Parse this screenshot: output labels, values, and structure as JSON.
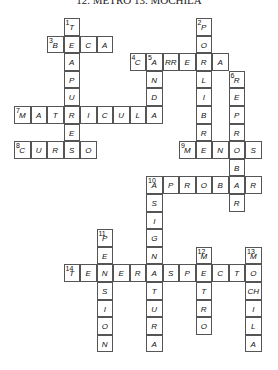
{
  "caption": "12. METRO  13. MOCHILA",
  "grid": {
    "x0": 14,
    "y0": 18,
    "cell_w": 16.5,
    "cell_h": 17.6
  },
  "words": [
    {
      "num": "1",
      "dir": "down",
      "col": 3,
      "row": 0,
      "letters": [
        "T",
        "E",
        "A",
        "P",
        "U",
        "R",
        "E"
      ]
    },
    {
      "num": "2",
      "dir": "down",
      "col": 11,
      "row": 0,
      "letters": [
        "P",
        "O",
        "R",
        "L",
        "I",
        "B",
        "R",
        "E"
      ]
    },
    {
      "num": "3",
      "dir": "across",
      "col": 2,
      "row": 1,
      "letters": [
        "B",
        "E",
        "C",
        "A"
      ]
    },
    {
      "num": "4",
      "dir": "across",
      "col": 7,
      "row": 2,
      "letters": [
        "C",
        "A",
        "RR",
        "E",
        "R",
        "A"
      ]
    },
    {
      "num": "5",
      "dir": "down",
      "col": 8,
      "row": 2,
      "letters": [
        "A",
        "N",
        "D",
        "A"
      ]
    },
    {
      "num": "6",
      "dir": "down",
      "col": 13,
      "row": 3,
      "letters": [
        "R",
        "E",
        "P",
        "R",
        "O",
        "B",
        "A",
        "R"
      ]
    },
    {
      "num": "7",
      "dir": "across",
      "col": 0,
      "row": 5,
      "letters": [
        "M",
        "A",
        "T",
        "R",
        "I",
        "C",
        "U",
        "L",
        "A"
      ]
    },
    {
      "num": "8",
      "dir": "across",
      "col": 0,
      "row": 7,
      "letters": [
        "C",
        "U",
        "R",
        "S",
        "O"
      ]
    },
    {
      "num": "9",
      "dir": "across",
      "col": 10,
      "row": 7,
      "letters": [
        "M",
        "E",
        "N",
        "O",
        "S"
      ]
    },
    {
      "num": "10",
      "dir": "across",
      "col": 8,
      "row": 9,
      "letters": [
        "A",
        "P",
        "R",
        "O",
        "B",
        "A",
        "R"
      ]
    },
    {
      "num": "10",
      "dir": "down",
      "col": 8,
      "row": 9,
      "letters": [
        "A",
        "S",
        "I",
        "G",
        "N",
        "A",
        "T",
        "U",
        "R",
        "A"
      ]
    },
    {
      "num": "11",
      "dir": "down",
      "col": 5,
      "row": 12,
      "letters": [
        "P",
        "E",
        "N",
        "S",
        "I",
        "O",
        "N"
      ]
    },
    {
      "num": "12",
      "dir": "down",
      "col": 11,
      "row": 13,
      "letters": [
        "M",
        "E",
        "T",
        "R",
        "O"
      ]
    },
    {
      "num": "13",
      "dir": "down",
      "col": 14,
      "row": 13,
      "letters": [
        "M",
        "O",
        "CH",
        "I",
        "L",
        "A"
      ]
    },
    {
      "num": "14",
      "dir": "across",
      "col": 3,
      "row": 14,
      "letters": [
        "T",
        "E",
        "N",
        "E",
        "R",
        "A",
        "S",
        "P",
        "E",
        "C",
        "T",
        "O"
      ]
    }
  ]
}
